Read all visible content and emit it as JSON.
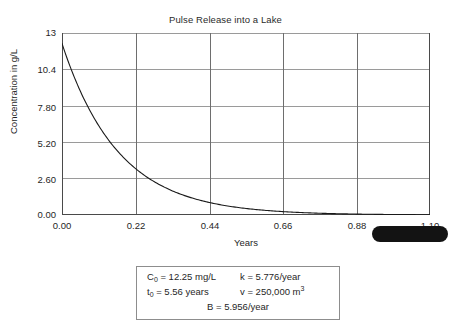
{
  "chart_data": {
    "type": "line",
    "title": "Pulse Release into a Lake",
    "xlabel": "Years",
    "ylabel": "Concentration in g/L",
    "xlim": [
      0.0,
      1.1
    ],
    "ylim": [
      0.0,
      13.0
    ],
    "grid": true,
    "legend": "none",
    "xticks": [
      "0.00",
      "0.22",
      "0.44",
      "0.66",
      "0.88",
      "1.10"
    ],
    "xtick_values": [
      0.0,
      0.22,
      0.44,
      0.66,
      0.88,
      1.1
    ],
    "yticks": [
      "0.00",
      "2.60",
      "5.20",
      "7.80",
      "10.4",
      "13"
    ],
    "ytick_values": [
      0.0,
      2.6,
      5.2,
      7.8,
      10.4,
      13.0
    ],
    "series": [
      {
        "name": "Concentration",
        "equation": "C = 12.25 * exp(-5.956 * t)",
        "color": "#1a1a1a",
        "x": [
          0.0,
          0.05,
          0.1,
          0.15,
          0.2,
          0.25,
          0.3,
          0.35,
          0.4,
          0.45,
          0.5,
          0.55,
          0.6,
          0.65,
          0.7,
          0.75,
          0.8,
          0.85,
          0.9,
          0.95,
          1.0,
          1.05,
          1.1
        ],
        "y": [
          12.25,
          9.1,
          6.76,
          5.02,
          3.73,
          2.77,
          2.06,
          1.53,
          1.14,
          0.84,
          0.63,
          0.47,
          0.35,
          0.26,
          0.19,
          0.14,
          0.1,
          0.08,
          0.06,
          0.04,
          0.03,
          0.02,
          0.02
        ]
      }
    ]
  },
  "parameters": {
    "rows": [
      {
        "left_prefix": "C",
        "left_sub": "0",
        "left_suffix": " = 12.25 mg/L",
        "right_prefix": "k = 5.776/year",
        "right_sup": "",
        "right_suffix": ""
      },
      {
        "left_prefix": "t",
        "left_sub": "0",
        "left_suffix": " = 5.56 years",
        "right_prefix": "v = 250,000 m",
        "right_sup": "3",
        "right_suffix": ""
      }
    ],
    "footer": "B = 5.956/year"
  },
  "artifacts": {
    "redaction_blob_name": "black-redaction-blob"
  },
  "colors": {
    "curve": "#1a1a1a",
    "grid": "#9a9a9a",
    "axis": "#6e6e6e",
    "text": "#1f1f1f",
    "blob": "#131313",
    "box_border": "#8d8d8d"
  }
}
